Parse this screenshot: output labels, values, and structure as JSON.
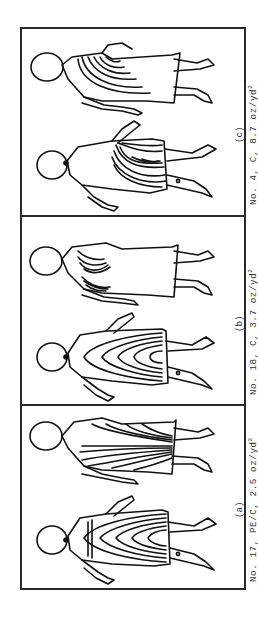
{
  "figure": {
    "panels": [
      {
        "id": "c",
        "tag": "(c)",
        "caption_main": "No. 4, C, 8.7 oz/yd",
        "caption_sup": "2",
        "sample_no": "4",
        "fabric": "C",
        "weight": "8.7 oz/yd²",
        "views": [
          "front",
          "back"
        ]
      },
      {
        "id": "b",
        "tag": "(b)",
        "caption_main": "No. 18, C, 3.7 oz/yd",
        "caption_sup": "2",
        "sample_no": "18",
        "fabric": "C",
        "weight": "3.7 oz/yd²",
        "views": [
          "front",
          "back"
        ]
      },
      {
        "id": "a",
        "tag": "(a)",
        "caption_main": "No. 17, PE/C, 2.5 oz/yd",
        "caption_sup": "2",
        "sample_no": "17",
        "fabric": "PE/C",
        "weight": "2.5 oz/yd²",
        "views": [
          "front",
          "back"
        ]
      }
    ],
    "colors": {
      "ink": "#111111",
      "frame": "#2a2a2a",
      "text": "#333333",
      "background": "#ffffff"
    }
  }
}
